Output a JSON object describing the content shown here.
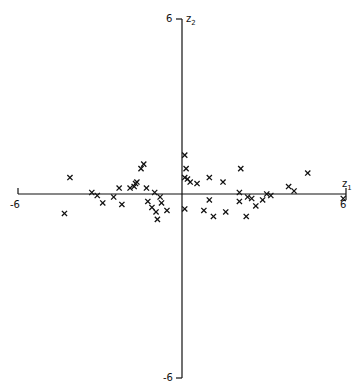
{
  "chart_data": {
    "type": "scatter",
    "title": "",
    "xlabel": "z1",
    "ylabel": "z2",
    "xlim": [
      -6,
      6
    ],
    "ylim": [
      -6,
      6
    ],
    "grid": false,
    "legend": null,
    "marker": "x",
    "axes_through_origin": true,
    "tick_labels": {
      "x_min": "-6",
      "x_max": "6",
      "y_min": "-6",
      "y_max": "6"
    },
    "points": [
      [
        -4.3,
        -0.65
      ],
      [
        -4.1,
        0.55
      ],
      [
        -3.3,
        0.05
      ],
      [
        -3.1,
        -0.05
      ],
      [
        -2.9,
        -0.3
      ],
      [
        -2.5,
        -0.1
      ],
      [
        -2.3,
        0.2
      ],
      [
        -2.2,
        -0.35
      ],
      [
        -1.9,
        0.2
      ],
      [
        -1.75,
        0.25
      ],
      [
        -1.7,
        0.35
      ],
      [
        -1.65,
        0.4
      ],
      [
        -1.5,
        0.85
      ],
      [
        -1.4,
        1.0
      ],
      [
        -1.3,
        0.2
      ],
      [
        -1.25,
        -0.25
      ],
      [
        -1.1,
        -0.45
      ],
      [
        -1.0,
        0.05
      ],
      [
        -0.95,
        -0.6
      ],
      [
        -0.9,
        -0.85
      ],
      [
        -0.8,
        -0.1
      ],
      [
        -0.75,
        -0.3
      ],
      [
        -0.55,
        -0.55
      ],
      [
        0.1,
        1.3
      ],
      [
        0.15,
        0.85
      ],
      [
        0.1,
        0.55
      ],
      [
        0.2,
        0.5
      ],
      [
        0.3,
        0.4
      ],
      [
        0.55,
        0.35
      ],
      [
        0.1,
        -0.5
      ],
      [
        0.8,
        -0.55
      ],
      [
        1.0,
        0.55
      ],
      [
        1.0,
        -0.2
      ],
      [
        1.15,
        -0.75
      ],
      [
        1.5,
        0.4
      ],
      [
        1.6,
        -0.6
      ],
      [
        2.1,
        0.05
      ],
      [
        2.15,
        0.85
      ],
      [
        2.1,
        -0.25
      ],
      [
        2.35,
        -0.75
      ],
      [
        2.4,
        -0.1
      ],
      [
        2.55,
        -0.15
      ],
      [
        2.7,
        -0.4
      ],
      [
        2.95,
        -0.2
      ],
      [
        3.1,
        0.0
      ],
      [
        3.25,
        -0.05
      ],
      [
        3.9,
        0.25
      ],
      [
        4.1,
        0.1
      ],
      [
        4.6,
        0.7
      ],
      [
        5.9,
        -0.15
      ]
    ]
  },
  "axes": {
    "x_label_main": "z",
    "x_label_sub": "1",
    "y_label_main": "z",
    "y_label_sub": "2",
    "x_min_label": "-6",
    "x_max_label": "6",
    "y_min_label": "-6",
    "y_max_label": "6"
  }
}
